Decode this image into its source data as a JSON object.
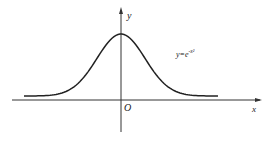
{
  "chart_data": {
    "type": "line",
    "title": "",
    "xlabel": "x",
    "ylabel": "y",
    "origin_label": "O",
    "annotations": [
      {
        "text": "y=e",
        "superscript": "-x²",
        "position": "right of peak"
      }
    ],
    "series": [
      {
        "name": "y=e^(-x^2)",
        "x": [
          -3,
          -2.5,
          -2,
          -1.5,
          -1,
          -0.5,
          0,
          0.5,
          1,
          1.5,
          2,
          2.5,
          3
        ],
        "values": [
          0.0001,
          0.0019,
          0.0183,
          0.1054,
          0.3679,
          0.7788,
          1.0,
          0.7788,
          0.3679,
          0.1054,
          0.0183,
          0.0019,
          0.0001
        ]
      }
    ],
    "grid": false,
    "legend": "none"
  },
  "labels": {
    "x_axis": "x",
    "y_axis": "y",
    "origin": "O",
    "equation_base": "y=e",
    "equation_exp": "-x²"
  }
}
